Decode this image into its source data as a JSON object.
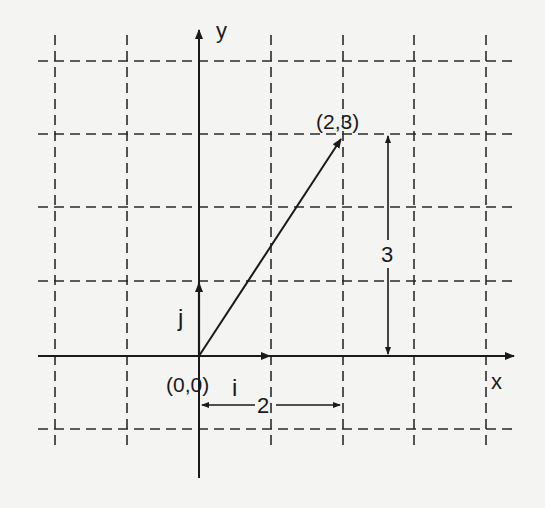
{
  "diagram": {
    "type": "coordinate-plane-vector",
    "axes": {
      "x_label": "x",
      "y_label": "y"
    },
    "origin_label": "(0,0)",
    "point_label": "(2,3)",
    "basis_vectors": {
      "i_label": "i",
      "j_label": "j"
    },
    "vector": {
      "from": [
        0,
        0
      ],
      "to": [
        2,
        3
      ]
    },
    "dimensions": {
      "horizontal_label": "2",
      "vertical_label": "3"
    },
    "grid": {
      "style": "dashed",
      "x_range": [
        -2,
        4
      ],
      "y_range": [
        -1,
        4
      ]
    }
  },
  "colors": {
    "background": "#f4f4f2",
    "ink": "#1a1a1a"
  }
}
